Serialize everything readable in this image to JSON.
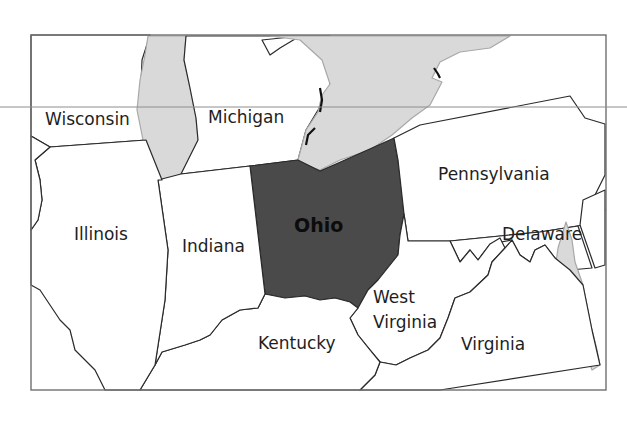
{
  "map": {
    "highlighted_state": "Ohio",
    "colors": {
      "highlight_fill": "#4a4a4a",
      "water_fill": "#d9d9d9",
      "land_fill": "#ffffff",
      "border": "#2a2a2a",
      "frame": "#6f6f6f"
    },
    "labels": {
      "wisconsin": "Wisconsin",
      "michigan": "Michigan",
      "pennsylvania": "Pennsylvania",
      "illinois": "Illinois",
      "indiana": "Indiana",
      "ohio": "Ohio",
      "delaware": "Delaware",
      "west_virginia_line1": "West",
      "west_virginia_line2": "Virginia",
      "kentucky": "Kentucky",
      "virginia": "Virginia"
    }
  }
}
